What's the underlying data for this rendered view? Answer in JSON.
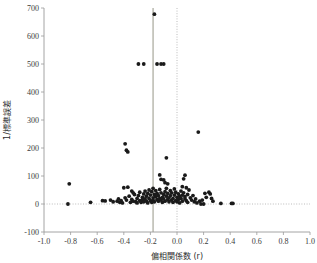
{
  "chart_data": {
    "type": "scatter",
    "title": "",
    "subtitle": "",
    "xlabel": "偏相関係数 (r)",
    "ylabel": "1/標準誤差",
    "xlim": [
      -1.0,
      1.0
    ],
    "ylim": [
      -100,
      700
    ],
    "xticks": [
      "-1.0",
      "-0.8",
      "-0.6",
      "-0.4",
      "-0.2",
      "0.0",
      "0.2",
      "0.4",
      "0.6",
      "0.8",
      "1.0"
    ],
    "xtick_values": [
      -1.0,
      -0.8,
      -0.6,
      -0.4,
      -0.2,
      0.0,
      0.2,
      0.4,
      0.6,
      0.8,
      1.0
    ],
    "yticks": [
      "-100",
      "0",
      "100",
      "200",
      "300",
      "400",
      "500",
      "600",
      "700"
    ],
    "ytick_values": [
      -100,
      0,
      100,
      200,
      300,
      400,
      500,
      600,
      700
    ],
    "grid": false,
    "legend": "none",
    "reference_lines": [
      {
        "name": "pooled-effect-line",
        "orientation": "vertical",
        "value": -0.18,
        "style": "solid",
        "color": "#8a8a7a"
      },
      {
        "name": "null-effect-line",
        "orientation": "vertical",
        "value": 0.0,
        "style": "dotted",
        "color": "#b4b4b4"
      },
      {
        "name": "zero-precision-line",
        "orientation": "horizontal",
        "value": 0,
        "style": "dotted",
        "color": "#b4b4b4"
      }
    ],
    "series": [
      {
        "name": "studies",
        "marker": "filled-circle",
        "color": "#1a1a1a",
        "points": [
          [
            -0.17,
            678
          ],
          [
            -0.29,
            500
          ],
          [
            -0.25,
            500
          ],
          [
            -0.15,
            500
          ],
          [
            -0.12,
            500
          ],
          [
            -0.1,
            500
          ],
          [
            -0.39,
            215
          ],
          [
            -0.38,
            192
          ],
          [
            -0.37,
            186
          ],
          [
            0.16,
            257
          ],
          [
            -0.08,
            165
          ],
          [
            -0.13,
            104
          ],
          [
            -0.12,
            88
          ],
          [
            -0.1,
            86
          ],
          [
            -0.09,
            76
          ],
          [
            -0.07,
            72
          ],
          [
            0.06,
            103
          ],
          [
            0.05,
            90
          ],
          [
            0.04,
            62
          ],
          [
            0.07,
            58
          ],
          [
            -0.4,
            58
          ],
          [
            -0.37,
            60
          ],
          [
            -0.34,
            46
          ],
          [
            -0.33,
            40
          ],
          [
            -0.81,
            72
          ],
          [
            -0.82,
            0
          ],
          [
            -0.65,
            6
          ],
          [
            -0.56,
            12
          ],
          [
            -0.54,
            11
          ],
          [
            -0.5,
            14
          ],
          [
            -0.48,
            8
          ],
          [
            -0.45,
            10
          ],
          [
            -0.44,
            18
          ],
          [
            -0.43,
            6
          ],
          [
            -0.42,
            12
          ],
          [
            -0.41,
            4
          ],
          [
            -0.39,
            22
          ],
          [
            -0.38,
            14
          ],
          [
            -0.36,
            28
          ],
          [
            -0.35,
            6
          ],
          [
            -0.34,
            16
          ],
          [
            -0.33,
            10
          ],
          [
            -0.32,
            34
          ],
          [
            -0.31,
            8
          ],
          [
            -0.3,
            20
          ],
          [
            -0.3,
            4
          ],
          [
            -0.29,
            30
          ],
          [
            -0.28,
            12
          ],
          [
            -0.28,
            42
          ],
          [
            -0.27,
            6
          ],
          [
            -0.26,
            24
          ],
          [
            -0.26,
            16
          ],
          [
            -0.25,
            36
          ],
          [
            -0.25,
            8
          ],
          [
            -0.24,
            46
          ],
          [
            -0.24,
            18
          ],
          [
            -0.23,
            10
          ],
          [
            -0.23,
            28
          ],
          [
            -0.22,
            38
          ],
          [
            -0.22,
            4
          ],
          [
            -0.21,
            20
          ],
          [
            -0.21,
            50
          ],
          [
            -0.2,
            12
          ],
          [
            -0.2,
            32
          ],
          [
            -0.19,
            6
          ],
          [
            -0.19,
            44
          ],
          [
            -0.18,
            22
          ],
          [
            -0.18,
            14
          ],
          [
            -0.18,
            56
          ],
          [
            -0.17,
            34
          ],
          [
            -0.17,
            8
          ],
          [
            -0.16,
            26
          ],
          [
            -0.16,
            48
          ],
          [
            -0.15,
            16
          ],
          [
            -0.15,
            38
          ],
          [
            -0.14,
            10
          ],
          [
            -0.14,
            30
          ],
          [
            -0.13,
            20
          ],
          [
            -0.13,
            52
          ],
          [
            -0.12,
            14
          ],
          [
            -0.12,
            40
          ],
          [
            -0.11,
            24
          ],
          [
            -0.11,
            6
          ],
          [
            -0.1,
            34
          ],
          [
            -0.1,
            18
          ],
          [
            -0.09,
            44
          ],
          [
            -0.09,
            10
          ],
          [
            -0.08,
            28
          ],
          [
            -0.08,
            56
          ],
          [
            -0.07,
            16
          ],
          [
            -0.07,
            38
          ],
          [
            -0.06,
            22
          ],
          [
            -0.06,
            8
          ],
          [
            -0.05,
            48
          ],
          [
            -0.05,
            30
          ],
          [
            -0.04,
            14
          ],
          [
            -0.04,
            40
          ],
          [
            -0.03,
            20
          ],
          [
            -0.03,
            6
          ],
          [
            -0.02,
            32
          ],
          [
            -0.02,
            54
          ],
          [
            -0.01,
            12
          ],
          [
            -0.01,
            42
          ],
          [
            0.0,
            24
          ],
          [
            0.0,
            8
          ],
          [
            0.01,
            36
          ],
          [
            0.01,
            16
          ],
          [
            0.02,
            28
          ],
          [
            0.02,
            4
          ],
          [
            0.03,
            46
          ],
          [
            0.03,
            20
          ],
          [
            0.04,
            32
          ],
          [
            0.04,
            10
          ],
          [
            0.05,
            40
          ],
          [
            0.06,
            18
          ],
          [
            0.06,
            26
          ],
          [
            0.07,
            12
          ],
          [
            0.08,
            34
          ],
          [
            0.08,
            6
          ],
          [
            0.09,
            50
          ],
          [
            0.1,
            22
          ],
          [
            0.11,
            14
          ],
          [
            0.12,
            30
          ],
          [
            0.13,
            8
          ],
          [
            0.14,
            18
          ],
          [
            0.15,
            4
          ],
          [
            0.17,
            10
          ],
          [
            0.19,
            14
          ],
          [
            0.21,
            38
          ],
          [
            0.22,
            24
          ],
          [
            0.24,
            42
          ],
          [
            0.25,
            36
          ],
          [
            0.26,
            20
          ],
          [
            0.27,
            10
          ],
          [
            0.33,
            2
          ],
          [
            0.41,
            2
          ],
          [
            0.42,
            2
          ],
          [
            0.18,
            0
          ],
          [
            0.2,
            0
          ]
        ]
      }
    ]
  }
}
